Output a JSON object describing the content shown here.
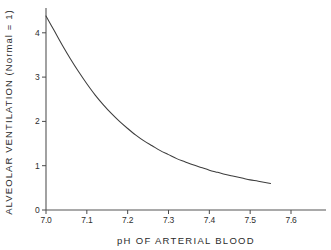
{
  "chart_data": {
    "type": "line",
    "title": "",
    "xlabel": "pH OF ARTERIAL BLOOD",
    "ylabel": "ALVEOLAR VENTILATION  (Normal = 1)",
    "xlim": [
      7.0,
      7.6
    ],
    "ylim": [
      0,
      4.5
    ],
    "grid": false,
    "legend": null,
    "x_ticks": [
      "7.0",
      "7.1",
      "7.2",
      "7.3",
      "7.4",
      "7.5",
      "7.6"
    ],
    "x_tick_values": [
      7.0,
      7.1,
      7.2,
      7.3,
      7.4,
      7.5,
      7.6
    ],
    "y_ticks": [
      "0",
      "1",
      "2",
      "3",
      "4"
    ],
    "y_tick_values": [
      0,
      1,
      2,
      3,
      4
    ],
    "series": [
      {
        "name": "Alveolar ventilation vs arterial pH",
        "color": "#3d3d3d",
        "x": [
          7.0,
          7.02,
          7.04,
          7.06,
          7.08,
          7.1,
          7.12,
          7.14,
          7.16,
          7.18,
          7.2,
          7.22,
          7.24,
          7.26,
          7.28,
          7.3,
          7.32,
          7.34,
          7.36,
          7.38,
          7.4,
          7.42,
          7.44,
          7.46,
          7.48,
          7.5,
          7.52,
          7.55
        ],
        "y": [
          4.38,
          4.05,
          3.72,
          3.41,
          3.12,
          2.85,
          2.6,
          2.38,
          2.18,
          2.0,
          1.84,
          1.69,
          1.56,
          1.45,
          1.34,
          1.25,
          1.16,
          1.09,
          1.02,
          0.96,
          0.9,
          0.85,
          0.8,
          0.76,
          0.72,
          0.68,
          0.65,
          0.6
        ]
      }
    ]
  },
  "axes": {
    "x_title": "pH OF ARTERIAL BLOOD",
    "y_title_line": "ALVEOLAR  VENTILATION  (Normal = 1)"
  },
  "colors": {
    "curve": "#3d3d3d",
    "axis": "#555555",
    "text": "#2b2b2b",
    "background": "#ffffff"
  }
}
